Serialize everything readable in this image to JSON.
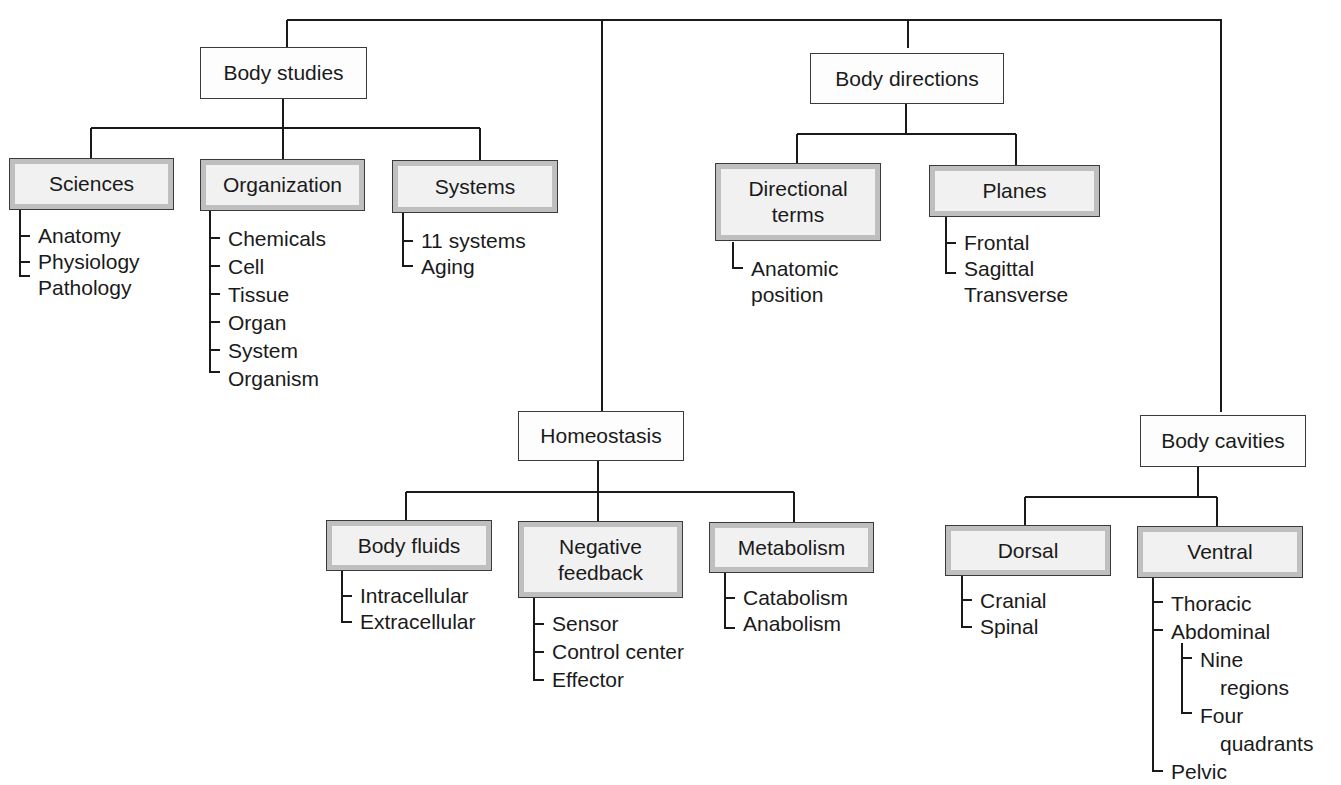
{
  "diagram": {
    "type": "hierarchy-tree",
    "colors": {
      "line": "#1a1a1a",
      "box_border": "#3a3a3a",
      "shaded_frame": "#bfbfbf",
      "shaded_fill": "#f1f1f1",
      "plain_fill": "#fdfdfd",
      "text": "#1a1a1a"
    },
    "top_level": [
      {
        "id": "body_studies",
        "label": "Body studies",
        "children": [
          {
            "id": "sciences",
            "label": "Sciences",
            "items": [
              "Anatomy",
              "Physiology",
              "Pathology"
            ]
          },
          {
            "id": "organization",
            "label": "Organization",
            "items": [
              "Chemicals",
              "Cell",
              "Tissue",
              "Organ",
              "System",
              "Organism"
            ]
          },
          {
            "id": "systems",
            "label": "Systems",
            "items": [
              "11 systems",
              "Aging"
            ]
          }
        ]
      },
      {
        "id": "homeostasis",
        "label": "Homeostasis",
        "children": [
          {
            "id": "body_fluids",
            "label": "Body fluids",
            "items": [
              "Intracellular",
              "Extracellular"
            ]
          },
          {
            "id": "negative_feedback",
            "label": "Negative feedback",
            "label_lines": [
              "Negative",
              "feedback"
            ],
            "items": [
              "Sensor",
              "Control center",
              "Effector"
            ]
          },
          {
            "id": "metabolism",
            "label": "Metabolism",
            "items": [
              "Catabolism",
              "Anabolism"
            ]
          }
        ]
      },
      {
        "id": "body_directions",
        "label": "Body directions",
        "children": [
          {
            "id": "directional_terms",
            "label": "Directional terms",
            "label_lines": [
              "Directional",
              "terms"
            ],
            "items": [
              "Anatomic position"
            ],
            "item_lines": [
              [
                "Anatomic",
                "position"
              ]
            ]
          },
          {
            "id": "planes",
            "label": "Planes",
            "items": [
              "Frontal",
              "Sagittal",
              "Transverse"
            ]
          }
        ]
      },
      {
        "id": "body_cavities",
        "label": "Body cavities",
        "children": [
          {
            "id": "dorsal",
            "label": "Dorsal",
            "items": [
              "Cranial",
              "Spinal"
            ]
          },
          {
            "id": "ventral",
            "label": "Ventral",
            "items": [
              "Thoracic",
              "Abdominal",
              "Pelvic"
            ],
            "abdominal_subitems": [
              {
                "label": "Nine regions",
                "lines": [
                  "Nine",
                  "regions"
                ]
              },
              {
                "label": "Four quadrants",
                "lines": [
                  "Four",
                  "quadrants"
                ]
              }
            ]
          }
        ]
      }
    ]
  }
}
